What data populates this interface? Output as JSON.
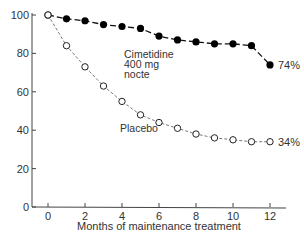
{
  "chart_data": {
    "type": "line",
    "title": "",
    "xlabel": "Months of maintenance treatment",
    "ylabel": "",
    "xlim": [
      -1,
      13
    ],
    "ylim": [
      0,
      100
    ],
    "x_ticks": [
      0,
      2,
      4,
      6,
      8,
      10,
      12
    ],
    "y_ticks": [
      0,
      20,
      40,
      60,
      80,
      100
    ],
    "grid": false,
    "legend": "inline labels",
    "x": [
      0,
      1,
      2,
      3,
      4,
      5,
      6,
      7,
      8,
      9,
      10,
      11,
      12
    ],
    "series": [
      {
        "name": "Cimetidine 400 mg nocte",
        "label_lines": [
          "Cimetidine",
          "400 mg",
          "nocte"
        ],
        "marker": "filled-circle",
        "line": "dashed",
        "values": [
          100,
          98,
          97,
          95,
          94,
          93,
          89,
          87,
          86,
          85,
          85,
          84,
          74
        ],
        "end_label": "74%"
      },
      {
        "name": "Placebo",
        "label_lines": [
          "Placebo"
        ],
        "marker": "open-circle",
        "line": "dotted-dashed",
        "values": [
          100,
          84,
          73,
          63,
          55,
          48,
          44,
          41,
          38,
          36,
          35,
          34,
          34
        ],
        "end_label": "34%"
      }
    ]
  }
}
